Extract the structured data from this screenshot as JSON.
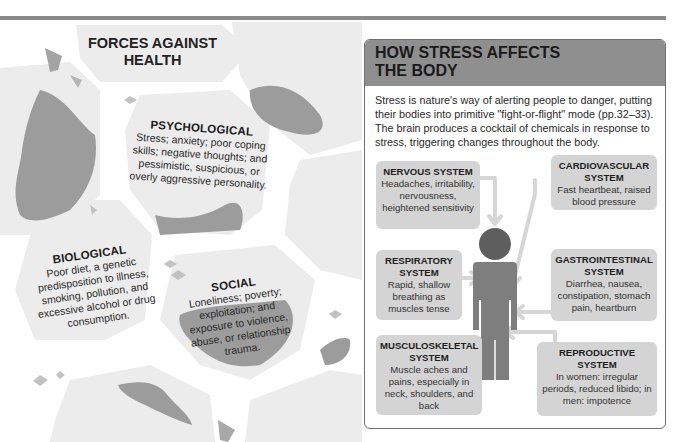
{
  "left_panel": {
    "title_line1": "FORCES AGAINST",
    "title_line2": "HEALTH",
    "forces": [
      {
        "id": "psychological",
        "title": "PSYCHOLOGICAL",
        "text": "Stress; anxiety; poor coping skills; negative thoughts; and pessimistic, suspicious, or overly aggressive personality."
      },
      {
        "id": "biological",
        "title": "BIOLOGICAL",
        "text": "Poor diet, a genetic predisposition to illness, smoking, pollution, and excessive alcohol or drug consumption."
      },
      {
        "id": "social",
        "title": "SOCIAL",
        "text": "Loneliness; poverty; exploitation; and exposure to violence, abuse, or relationship trauma."
      }
    ]
  },
  "right_panel": {
    "title_line1": "HOW STRESS AFFECTS",
    "title_line2": "THE BODY",
    "intro": "Stress is nature's way of alerting people to danger, putting their bodies into primitive \"fight-or-flight\" mode (pp.32–33). The brain produces a cocktail of chemicals in response to stress, triggering changes throughout the body.",
    "systems": [
      {
        "id": "nervous",
        "title": "NERVOUS SYSTEM",
        "text": "Headaches, irritability, nervousness, heightened sensitivity"
      },
      {
        "id": "cardiovascular",
        "title": "CARDIOVASCULAR SYSTEM",
        "text": "Fast heartbeat, raised blood pressure"
      },
      {
        "id": "respiratory",
        "title": "RESPIRATORY SYSTEM",
        "text": "Rapid, shallow breathing as muscles tense"
      },
      {
        "id": "gastrointestinal",
        "title": "GASTROINTESTINAL SYSTEM",
        "text": "Diarrhea, nausea, constipation, stomach pain, heartburn"
      },
      {
        "id": "musculoskeletal",
        "title": "MUSCULOSKELETAL SYSTEM",
        "text": "Muscle aches and pains, especially in neck, shoulders, and back"
      },
      {
        "id": "reproductive",
        "title": "REPRODUCTIVE SYSTEM",
        "text": "In women: irregular periods, reduced libido; in men: impotence"
      }
    ]
  },
  "colors": {
    "header_gray": "#8f8f8f",
    "box_gray": "#d4d4d4",
    "hex_light": "#ededed",
    "blob_dark": "#9c9c9c",
    "figure": "#7e7e7e",
    "head": "#5e5e5e",
    "arrow": "#d6d6d6"
  }
}
